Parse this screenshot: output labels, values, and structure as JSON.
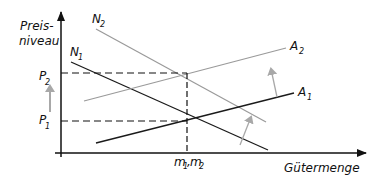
{
  "diagram": {
    "y_axis_label_line1": "Preis-",
    "y_axis_label_line2": "niveau",
    "x_axis_label": "Gütermenge",
    "price_labels": {
      "p2": {
        "main": "P",
        "sub": "2"
      },
      "p1": {
        "main": "P",
        "sub": "1"
      }
    },
    "quantity_label": {
      "m1": "m",
      "sub1": "1",
      "sep": ",",
      "m2": "m",
      "sub2": "2"
    },
    "curves": {
      "N1": {
        "main": "N",
        "sub": "1",
        "color": "#1a1a1a"
      },
      "N2": {
        "main": "N",
        "sub": "2",
        "color": "#9a9a9a"
      },
      "A1": {
        "main": "A",
        "sub": "1",
        "color": "#1a1a1a"
      },
      "A2": {
        "main": "A",
        "sub": "2",
        "color": "#9a9a9a"
      }
    },
    "colors": {
      "axis": "#111111",
      "shift_arrow": "#a8a8a8",
      "dashed": "#111111"
    }
  }
}
